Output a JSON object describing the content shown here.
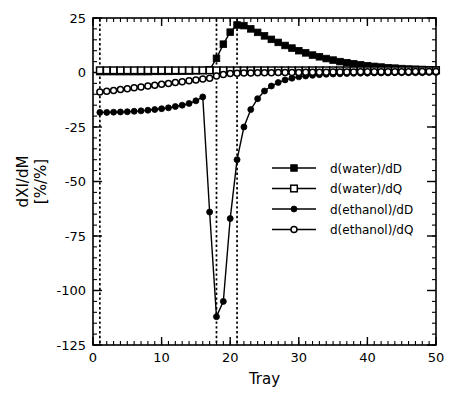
{
  "chart_data": {
    "type": "line",
    "title": "",
    "xlabel": "Tray",
    "ylabel": "dXI/dM",
    "ylabel_line2": "[%/%]",
    "xlim": [
      0,
      50
    ],
    "ylim": [
      -125,
      25
    ],
    "xticks": [
      0,
      10,
      20,
      30,
      40,
      50
    ],
    "xticklabels": [
      "0",
      "10",
      "20",
      "30",
      "40",
      "50"
    ],
    "yticks": [
      25,
      0,
      -25,
      -50,
      -75,
      -100,
      -125
    ],
    "yticklabels": [
      "25",
      "0",
      "-25",
      "-50",
      "-75",
      "-100",
      "-125"
    ],
    "x_minor_step": 1,
    "y_minor_step": 5,
    "grid": false,
    "legend_position": "center-right",
    "annotations": {
      "vertical_dotted_lines": [
        1,
        18,
        21
      ]
    },
    "x": [
      1,
      2,
      3,
      4,
      5,
      6,
      7,
      8,
      9,
      10,
      11,
      12,
      13,
      14,
      15,
      16,
      17,
      18,
      19,
      20,
      21,
      22,
      23,
      24,
      25,
      26,
      27,
      28,
      29,
      30,
      31,
      32,
      33,
      34,
      35,
      36,
      37,
      38,
      39,
      40,
      41,
      42,
      43,
      44,
      45,
      46,
      47,
      48,
      49,
      50
    ],
    "series": [
      {
        "name": "d(water)/dD",
        "marker": "filled-square",
        "values": [
          0.4,
          0.4,
          0.4,
          0.4,
          0.4,
          0.4,
          0.4,
          0.4,
          0.5,
          0.5,
          0.5,
          0.6,
          0.6,
          0.7,
          0.8,
          0.9,
          1.2,
          6.5,
          13.0,
          18.5,
          21.8,
          21.5,
          20.0,
          18.4,
          16.8,
          15.2,
          13.8,
          12.4,
          11.2,
          10.0,
          9.0,
          8.0,
          7.2,
          6.4,
          5.7,
          5.0,
          4.5,
          4.0,
          3.5,
          3.1,
          2.8,
          2.5,
          2.2,
          2.0,
          1.8,
          1.6,
          1.5,
          1.4,
          1.3,
          1.2
        ]
      },
      {
        "name": "d(water)/dQ",
        "marker": "open-square",
        "values": [
          1.0,
          1.0,
          1.0,
          1.0,
          1.0,
          1.0,
          1.0,
          1.0,
          1.0,
          1.0,
          1.0,
          1.0,
          1.0,
          1.0,
          1.0,
          1.0,
          1.0,
          1.0,
          1.0,
          1.0,
          1.0,
          1.0,
          1.0,
          1.0,
          1.0,
          1.0,
          1.0,
          1.0,
          1.0,
          1.0,
          1.0,
          1.0,
          1.0,
          1.0,
          1.0,
          1.0,
          1.0,
          1.0,
          1.0,
          1.0,
          1.0,
          1.0,
          1.0,
          1.0,
          1.0,
          1.0,
          1.0,
          1.0,
          1.0,
          1.0
        ]
      },
      {
        "name": "d(ethanol)/dD",
        "marker": "filled-circle",
        "values": [
          -18.3,
          -18.3,
          -18.2,
          -18.1,
          -18.0,
          -17.8,
          -17.6,
          -17.3,
          -17.0,
          -16.6,
          -16.2,
          -15.6,
          -15.0,
          -14.2,
          -13.0,
          -11.2,
          -64.0,
          -112.0,
          -105.0,
          -67.0,
          -40.0,
          -25.0,
          -17.0,
          -12.0,
          -8.5,
          -6.2,
          -4.6,
          -3.4,
          -2.6,
          -2.0,
          -1.6,
          -1.3,
          -1.0,
          -0.8,
          -0.7,
          -0.6,
          -0.5,
          -0.4,
          -0.3,
          -0.3,
          -0.2,
          -0.2,
          -0.2,
          -0.1,
          -0.1,
          -0.1,
          -0.1,
          -0.1,
          0.0,
          0.0
        ]
      },
      {
        "name": "d(ethanol)/dQ",
        "marker": "open-circle",
        "values": [
          -9.0,
          -8.6,
          -8.2,
          -7.8,
          -7.4,
          -7.0,
          -6.6,
          -6.2,
          -5.8,
          -5.4,
          -5.0,
          -4.6,
          -4.2,
          -3.8,
          -3.4,
          -3.0,
          -2.6,
          -1.6,
          -0.9,
          -0.5,
          -0.3,
          -0.2,
          -0.2,
          -0.1,
          -0.1,
          -0.1,
          0.0,
          0.0,
          0.0,
          0.0,
          0.1,
          0.1,
          0.1,
          0.1,
          0.2,
          0.2,
          0.2,
          0.2,
          0.3,
          0.3,
          0.3,
          0.3,
          0.4,
          0.4,
          0.4,
          0.4,
          0.5,
          0.5,
          0.5,
          0.5
        ]
      }
    ],
    "legend": [
      {
        "label": "d(water)/dD",
        "marker": "filled-square"
      },
      {
        "label": "d(water)/dQ",
        "marker": "open-square"
      },
      {
        "label": "d(ethanol)/dD",
        "marker": "filled-circle"
      },
      {
        "label": "d(ethanol)/dQ",
        "marker": "open-circle"
      }
    ],
    "colors": {
      "axis": "#000000",
      "series": "#000000",
      "background": "#ffffff"
    }
  }
}
